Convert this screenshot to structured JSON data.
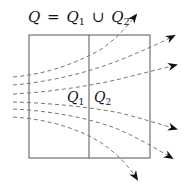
{
  "title": {
    "lhs": "Q",
    "eq": "=",
    "q1_base": "Q",
    "q1_sub": "1",
    "union": "∪",
    "q2_base": "Q",
    "q2_sub": "2"
  },
  "regions": [
    {
      "name": "Q1",
      "base": "Q",
      "sub": "1"
    },
    {
      "name": "Q2",
      "base": "Q",
      "sub": "2"
    }
  ],
  "colors": {
    "box_stroke": "#555555",
    "flow_stroke": "#777777",
    "arrow_fill": "#111111",
    "text": "#111111"
  },
  "box": {
    "x": 29,
    "y": 35,
    "width": 121,
    "height": 123,
    "divider_x": 89
  },
  "flow_lines": [
    {
      "id": 1,
      "path": "M13,77 C45,74 70,66 100,50 C115,40 126,28 136,15",
      "arrow_tip": [
        138,
        12
      ]
    },
    {
      "id": 2,
      "path": "M13,85 C50,82 90,72 120,60 C140,52 158,44 174,36",
      "arrow_tip": [
        176,
        35
      ]
    },
    {
      "id": 3,
      "path": "M13,94 C50,92 90,86 120,79 C140,74 160,69 176,65",
      "arrow_tip": [
        178,
        64
      ]
    },
    {
      "id": 4,
      "path": "M13,102 C50,103 90,107 120,113 C140,118 160,124 176,129",
      "arrow_tip": [
        178,
        130
      ]
    },
    {
      "id": 5,
      "path": "M13,109 C50,111 85,117 115,128 C135,136 155,148 172,158",
      "arrow_tip": [
        174,
        160
      ]
    },
    {
      "id": 6,
      "path": "M13,117 C45,119 75,127 100,142 C118,154 130,168 137,179",
      "arrow_tip": [
        139,
        182
      ]
    }
  ]
}
